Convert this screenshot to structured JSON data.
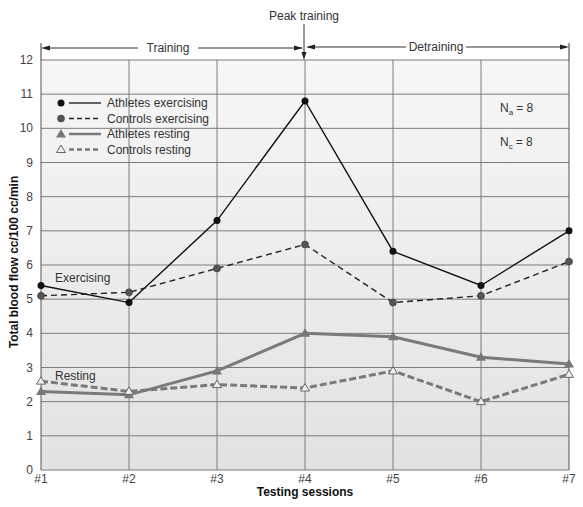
{
  "chart_data": {
    "type": "line",
    "title": "",
    "xlabel": "Testing sessions",
    "ylabel": "Total blood flow cc/100 cc/min",
    "ylim": [
      0,
      12
    ],
    "yticks": [
      0,
      1,
      2,
      3,
      4,
      5,
      6,
      7,
      8,
      9,
      10,
      11,
      12
    ],
    "grid": true,
    "legend_position": "upper-left",
    "categories": [
      "#1",
      "#2",
      "#3",
      "#4",
      "#5",
      "#6",
      "#7"
    ],
    "series": [
      {
        "name": "Athletes exercising",
        "values": [
          5.4,
          4.9,
          7.3,
          10.8,
          6.4,
          5.4,
          7.0
        ],
        "color": "#111111",
        "dash": "solid",
        "marker": "circle-filled",
        "width": 1.4
      },
      {
        "name": "Controls exercising",
        "values": [
          5.1,
          5.2,
          5.9,
          6.6,
          4.9,
          5.1,
          6.1
        ],
        "color": "#222222",
        "dash": "dashed",
        "marker": "circle-gray",
        "width": 1.4
      },
      {
        "name": "Athletes resting",
        "values": [
          2.3,
          2.2,
          2.9,
          4.0,
          3.9,
          3.3,
          3.1
        ],
        "color": "#7a7a7a",
        "dash": "solid",
        "marker": "triangle-filled",
        "width": 3
      },
      {
        "name": "Controls resting",
        "values": [
          2.6,
          2.3,
          2.5,
          2.4,
          2.9,
          2.0,
          2.8
        ],
        "color": "#7a7a7a",
        "dash": "dashed",
        "marker": "triangle-open",
        "width": 3
      }
    ],
    "annotations": {
      "peak": "Peak training",
      "phase_training": "Training",
      "phase_detraining": "Detraining",
      "group_exercising": "Exercising",
      "group_resting": "Resting",
      "n_athletes_main": "N",
      "n_athletes_sub": "a",
      "n_athletes_value": "= 8",
      "n_controls_main": "N",
      "n_controls_sub": "c",
      "n_controls_value": "= 8"
    }
  },
  "colors": {
    "plot_background": "#e8e8e8",
    "grid": "#7d7d7d",
    "accent_dark": "#111111",
    "accent_gray": "#7a7a7a"
  }
}
